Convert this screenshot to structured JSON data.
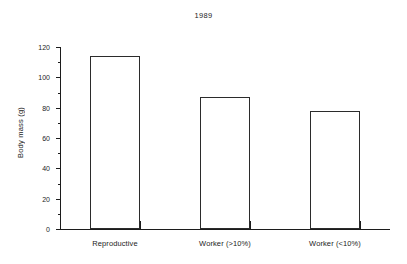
{
  "chart_data": {
    "type": "bar",
    "title": "1989",
    "xlabel": "",
    "ylabel": "Body mass (g)",
    "categories": [
      "Reproductive",
      "Worker (>10%)",
      "Worker (<10%)"
    ],
    "values": [
      114,
      87,
      78
    ],
    "ylim": [
      0,
      120
    ],
    "ytick_labels": [
      "0",
      "20",
      "40",
      "60",
      "80",
      "100",
      "120"
    ],
    "ytick_values": [
      0,
      20,
      40,
      60,
      80,
      100,
      120
    ],
    "yminor_tick_values": [
      10,
      30,
      50,
      70,
      90,
      110
    ],
    "grid": false,
    "legend": "none",
    "bar_style": {
      "fill": "#ffffff",
      "edge_color": "#2b2b2b"
    },
    "axis_color": "#1c1c1c"
  }
}
